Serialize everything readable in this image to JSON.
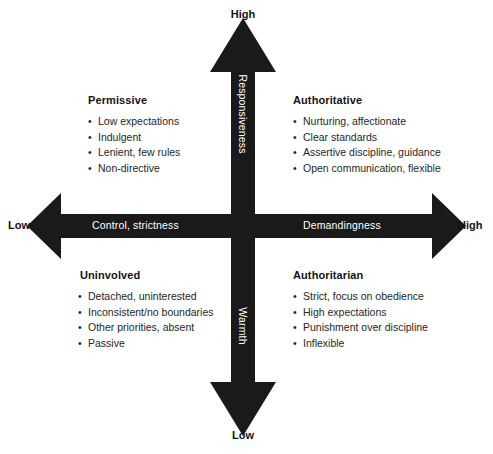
{
  "figure": {
    "type": "2x2-quadrant-diagram",
    "topic": "Parenting styles by responsiveness/warmth and demandingness/control",
    "colors": {
      "arrow_fill": "#1a1a1a",
      "background": "#ffffff",
      "heading_text": "#141414",
      "body_text": "#262626",
      "shaft_label_text": "#ffffff"
    }
  },
  "axes": {
    "vertical": {
      "upper_label": "Responsiveness",
      "lower_label": "Warmth",
      "top_endcap": "High",
      "bottom_endcap": "Low"
    },
    "horizontal": {
      "left_label": "Control, strictness",
      "right_label": "Demandingness",
      "left_endcap": "Low",
      "right_endcap": "High"
    }
  },
  "quadrants": [
    {
      "id": "permissive",
      "position": "top-left",
      "title": "Permissive",
      "items": [
        "Low expectations",
        "Indulgent",
        "Lenient, few rules",
        "Non-directive"
      ]
    },
    {
      "id": "authoritative",
      "position": "top-right",
      "title": "Authoritative",
      "items": [
        "Nurturing, affectionate",
        "Clear standards",
        "Assertive discipline, guidance",
        "Open communication, flexible"
      ]
    },
    {
      "id": "uninvolved",
      "position": "bottom-left",
      "title": "Uninvolved",
      "items": [
        "Detached, uninterested",
        "Inconsistent/no boundaries",
        "Other priorities, absent",
        "Passive"
      ]
    },
    {
      "id": "authoritarian",
      "position": "bottom-right",
      "title": "Authoritarian",
      "items": [
        "Strict, focus on obedience",
        "High expectations",
        "Punishment over discipline",
        "Inflexible"
      ]
    }
  ],
  "caption": ""
}
